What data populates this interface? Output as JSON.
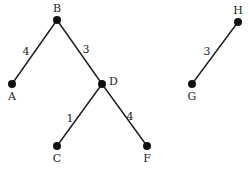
{
  "nodes": [
    {
      "id": "B",
      "label": "B"
    },
    {
      "id": "A",
      "label": "A"
    },
    {
      "id": "D",
      "label": "D"
    },
    {
      "id": "C",
      "label": "C"
    },
    {
      "id": "F",
      "label": "F"
    },
    {
      "id": "H",
      "label": "H"
    },
    {
      "id": "G",
      "label": "G"
    }
  ],
  "edges": [
    {
      "from": "B",
      "to": "A",
      "weight": "4"
    },
    {
      "from": "B",
      "to": "D",
      "weight": "3"
    },
    {
      "from": "D",
      "to": "C",
      "weight": "1"
    },
    {
      "from": "D",
      "to": "F",
      "weight": "4"
    },
    {
      "from": "H",
      "to": "G",
      "weight": "3"
    }
  ]
}
